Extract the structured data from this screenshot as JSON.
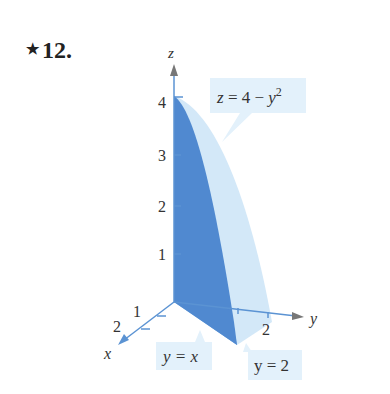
{
  "problem": {
    "star": "★",
    "number": "12."
  },
  "axes": {
    "x_label": "x",
    "y_label": "y",
    "z_label": "z"
  },
  "ticks": {
    "z": [
      "1",
      "2",
      "3",
      "4"
    ],
    "x": [
      "1",
      "2"
    ],
    "y": [
      "2"
    ]
  },
  "callouts": {
    "surface": {
      "lhs": "z = 4 − y",
      "exp": "2"
    },
    "plane_diag": "y = x",
    "plane_y2": "y = 2"
  },
  "colors": {
    "dark_face": "#4f86cf",
    "light_face": "#cfe6f7",
    "mid_face": "#7fb0e2",
    "axis": "#5b93d3",
    "callout_bg": "#e3f1fb"
  }
}
